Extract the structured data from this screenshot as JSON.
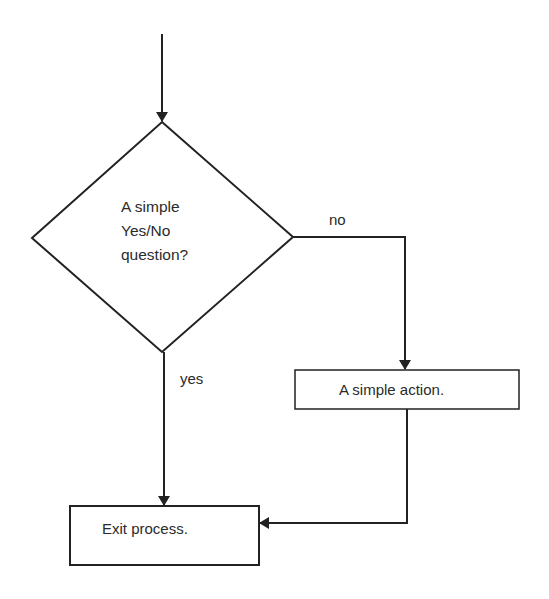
{
  "diagram": {
    "type": "flowchart",
    "line_color": "#222222",
    "background": "#ffffff",
    "decision": {
      "lines": [
        "A simple",
        "Yes/No",
        "question?"
      ]
    },
    "branches": {
      "no_label": "no",
      "yes_label": "yes"
    },
    "action": {
      "label": "A simple action."
    },
    "exit": {
      "label": "Exit process."
    }
  }
}
